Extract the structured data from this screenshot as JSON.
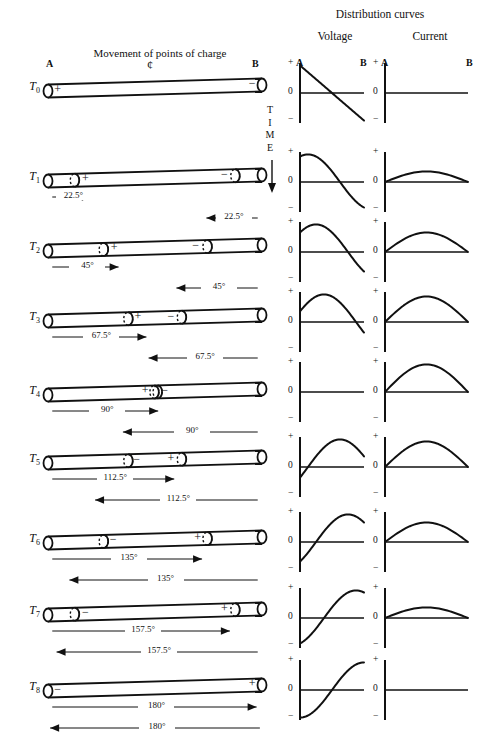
{
  "headings": {
    "distribution": "Distribution curves",
    "voltage": "Voltage",
    "current": "Current",
    "movement": "Movement of points of charge",
    "time": "TIME",
    "center_symbol": "¢"
  },
  "endpoint_labels": {
    "a": "A",
    "b": "B"
  },
  "axis_ticks": {
    "plus": "+",
    "zero": "0",
    "minus": "−"
  },
  "signs": {
    "positive": "+",
    "negative": "−"
  },
  "rows": [
    {
      "time_label": "T",
      "time_sub": "0",
      "charges": [
        {
          "pos": 0.045,
          "sign": "+"
        },
        {
          "pos": 0.955,
          "sign": "−"
        }
      ],
      "node_rings": [],
      "forward_arrow": null,
      "reverse_arrow": null,
      "voltage": {
        "type": "line",
        "start": 1.0,
        "end": -1.0,
        "phase": 0
      },
      "current": {
        "type": "flat",
        "amplitude": 0.0
      }
    },
    {
      "time_label": "T",
      "time_sub": "1",
      "charges": [
        {
          "pos": 0.175,
          "sign": "+"
        },
        {
          "pos": 0.825,
          "sign": "−"
        }
      ],
      "node_rings": [
        0.125,
        0.875
      ],
      "forward_arrow": {
        "label": "22.5°",
        "from": 0.02,
        "to": 0.2,
        "dir": "right"
      },
      "reverse_arrow": {
        "label": "22.5°",
        "from": 0.98,
        "to": 0.74,
        "dir": "left"
      },
      "voltage": {
        "type": "cos",
        "amplitude": 0.92,
        "phase": 22.5
      },
      "current": {
        "type": "sin",
        "amplitude": 0.38,
        "phase": 22.5
      }
    },
    {
      "time_label": "T",
      "time_sub": "2",
      "charges": [
        {
          "pos": 0.31,
          "sign": "+"
        },
        {
          "pos": 0.69,
          "sign": "−"
        }
      ],
      "node_rings": [
        0.26,
        0.745
      ],
      "forward_arrow": {
        "label": "45°",
        "from": 0.02,
        "to": 0.33,
        "dir": "right"
      },
      "reverse_arrow": {
        "label": "45°",
        "from": 0.98,
        "to": 0.6,
        "dir": "left"
      },
      "voltage": {
        "type": "cos",
        "amplitude": 0.72,
        "phase": 45
      },
      "current": {
        "type": "sin",
        "amplitude": 0.7,
        "phase": 45
      }
    },
    {
      "time_label": "T",
      "time_sub": "3",
      "charges": [
        {
          "pos": 0.42,
          "sign": "+"
        },
        {
          "pos": 0.575,
          "sign": "−"
        }
      ],
      "node_rings": [
        0.375,
        0.625
      ],
      "forward_arrow": {
        "label": "67.5°",
        "from": 0.02,
        "to": 0.46,
        "dir": "right"
      },
      "reverse_arrow": {
        "label": "67.5°",
        "from": 0.98,
        "to": 0.47,
        "dir": "left"
      },
      "voltage": {
        "type": "cos",
        "amplitude": 0.45,
        "phase": 67.5
      },
      "current": {
        "type": "sin",
        "amplitude": 0.9,
        "phase": 67.5
      }
    },
    {
      "time_label": "T",
      "time_sub": "4",
      "charges": [
        {
          "pos": 0.455,
          "sign": "+"
        },
        {
          "pos": 0.545,
          "sign": "−"
        }
      ],
      "node_rings": [
        0.497,
        0.512
      ],
      "forward_arrow": {
        "label": "90°",
        "from": 0.02,
        "to": 0.515,
        "dir": "right"
      },
      "reverse_arrow": {
        "label": "90°",
        "from": 0.98,
        "to": 0.35,
        "dir": "left"
      },
      "voltage": {
        "type": "flat",
        "amplitude": 0.0
      },
      "current": {
        "type": "sin",
        "amplitude": 1.0,
        "phase": 90
      }
    },
    {
      "time_label": "T",
      "time_sub": "5",
      "charges": [
        {
          "pos": 0.415,
          "sign": "−"
        },
        {
          "pos": 0.575,
          "sign": "+"
        }
      ],
      "node_rings": [
        0.375,
        0.625
      ],
      "forward_arrow": {
        "label": "112.5°",
        "from": 0.02,
        "to": 0.59,
        "dir": "right"
      },
      "reverse_arrow": {
        "label": "112.5°",
        "from": 0.98,
        "to": 0.22,
        "dir": "left"
      },
      "voltage": {
        "type": "cos",
        "amplitude": -0.45,
        "phase": 112.5
      },
      "current": {
        "type": "sin",
        "amplitude": 0.9,
        "phase": 112.5
      }
    },
    {
      "time_label": "T",
      "time_sub": "6",
      "charges": [
        {
          "pos": 0.305,
          "sign": "−"
        },
        {
          "pos": 0.7,
          "sign": "+"
        }
      ],
      "node_rings": [
        0.26,
        0.745
      ],
      "forward_arrow": {
        "label": "135°",
        "from": 0.02,
        "to": 0.72,
        "dir": "right"
      },
      "reverse_arrow": {
        "label": "135°",
        "from": 0.98,
        "to": 0.1,
        "dir": "left"
      },
      "voltage": {
        "type": "cos",
        "amplitude": -0.72,
        "phase": 135
      },
      "current": {
        "type": "sin",
        "amplitude": 0.7,
        "phase": 135
      }
    },
    {
      "time_label": "T",
      "time_sub": "7",
      "charges": [
        {
          "pos": 0.175,
          "sign": "−"
        },
        {
          "pos": 0.825,
          "sign": "+"
        }
      ],
      "node_rings": [
        0.125,
        0.875
      ],
      "forward_arrow": {
        "label": "157.5°",
        "from": 0.02,
        "to": 0.85,
        "dir": "right"
      },
      "reverse_arrow": {
        "label": "157.5°",
        "from": 0.98,
        "to": 0.04,
        "dir": "left"
      },
      "voltage": {
        "type": "cos",
        "amplitude": -0.92,
        "phase": 157.5
      },
      "current": {
        "type": "sin",
        "amplitude": 0.38,
        "phase": 157.5
      }
    },
    {
      "time_label": "T",
      "time_sub": "8",
      "charges": [
        {
          "pos": 0.045,
          "sign": "−"
        },
        {
          "pos": 0.955,
          "sign": "+"
        }
      ],
      "node_rings": [],
      "forward_arrow": {
        "label": "180°",
        "from": 0.02,
        "to": 0.975,
        "dir": "right"
      },
      "reverse_arrow": {
        "label": "180°",
        "from": 0.99,
        "to": 0.01,
        "dir": "left"
      },
      "voltage": {
        "type": "cos",
        "amplitude": -1.0,
        "phase": 180
      },
      "current": {
        "type": "flat",
        "amplitude": 0.0
      }
    }
  ],
  "chart_data": {
    "type": "line",
    "title": "Distribution curves",
    "xlabel": "Position along line (A to B)",
    "ylabel": "Amplitude",
    "ylim": [
      -1,
      1
    ],
    "x": [
      "A",
      "B"
    ],
    "panels": [
      {
        "row": "T0",
        "voltage_profile": [
          1.0,
          0.92,
          0.71,
          0.38,
          0.0,
          -0.38,
          -0.71,
          -0.92,
          -1.0
        ],
        "current_profile": [
          0,
          0,
          0,
          0,
          0,
          0,
          0,
          0,
          0
        ]
      },
      {
        "row": "T1",
        "voltage_profile": [
          0.92,
          1.0,
          0.92,
          0.71,
          0.38,
          0.0,
          -0.38,
          -0.71,
          -0.92
        ],
        "current_profile": [
          0.0,
          0.19,
          0.33,
          0.38,
          0.36,
          0.28,
          0.17,
          0.06,
          0.0
        ]
      },
      {
        "row": "T2",
        "voltage_profile": [
          0.71,
          0.92,
          1.0,
          0.92,
          0.71,
          0.38,
          0.0,
          -0.38,
          -0.71
        ],
        "current_profile": [
          0.0,
          0.3,
          0.55,
          0.68,
          0.7,
          0.61,
          0.42,
          0.2,
          0.0
        ]
      },
      {
        "row": "T3",
        "voltage_profile": [
          0.38,
          0.71,
          0.92,
          1.0,
          0.92,
          0.71,
          0.38,
          0.0,
          -0.38
        ],
        "current_profile": [
          0.0,
          0.38,
          0.68,
          0.86,
          0.9,
          0.8,
          0.57,
          0.28,
          0.0
        ]
      },
      {
        "row": "T4",
        "voltage_profile": [
          0,
          0,
          0,
          0,
          0,
          0,
          0,
          0,
          0
        ],
        "current_profile": [
          0.0,
          0.42,
          0.76,
          0.96,
          1.0,
          0.89,
          0.64,
          0.32,
          0.0
        ]
      },
      {
        "row": "T5",
        "voltage_profile": [
          -0.38,
          0.0,
          0.38,
          0.71,
          0.92,
          1.0,
          0.92,
          0.71,
          0.38
        ],
        "current_profile": [
          0.0,
          0.38,
          0.68,
          0.86,
          0.9,
          0.8,
          0.57,
          0.28,
          0.0
        ]
      },
      {
        "row": "T6",
        "voltage_profile": [
          -0.71,
          -0.38,
          0.0,
          0.38,
          0.71,
          0.92,
          1.0,
          0.92,
          0.71
        ],
        "current_profile": [
          0.0,
          0.3,
          0.55,
          0.68,
          0.7,
          0.61,
          0.42,
          0.2,
          0.0
        ]
      },
      {
        "row": "T7",
        "voltage_profile": [
          -0.92,
          -0.71,
          -0.38,
          0.0,
          0.38,
          0.71,
          0.92,
          1.0,
          0.92
        ],
        "current_profile": [
          0.0,
          0.19,
          0.33,
          0.38,
          0.36,
          0.28,
          0.17,
          0.06,
          0.0
        ]
      },
      {
        "row": "T8",
        "voltage_profile": [
          -1.0,
          -0.92,
          -0.71,
          -0.38,
          0.0,
          0.38,
          0.71,
          0.92,
          1.0
        ],
        "current_profile": [
          0,
          0,
          0,
          0,
          0,
          0,
          0,
          0,
          0
        ]
      }
    ]
  }
}
